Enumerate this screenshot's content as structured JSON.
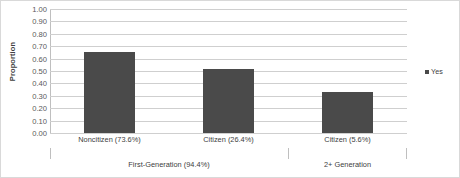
{
  "chart_data": {
    "type": "bar",
    "title": "",
    "xlabel": "",
    "ylabel": "Proportion",
    "ylim": [
      0,
      1
    ],
    "ytick_step": 0.1,
    "ytick_labels": [
      "1.00",
      "0.90",
      "0.80",
      "0.70",
      "0.60",
      "0.50",
      "0.40",
      "0.30",
      "0.20",
      "0.10",
      "0.00"
    ],
    "grid": true,
    "legend_position": "right",
    "legend": [
      "Yes"
    ],
    "categories": [
      "Noncitizen (73.6%)",
      "Citizen (26.4%)",
      "Citizen (5.6%)"
    ],
    "values": [
      0.65,
      0.52,
      0.33
    ],
    "series": [
      {
        "name": "Yes",
        "values": [
          0.65,
          0.52,
          0.33
        ]
      }
    ],
    "groups": [
      {
        "label": "First-Generation (94.4%)",
        "categories": [
          "Noncitizen (73.6%)",
          "Citizen (26.4%)"
        ]
      },
      {
        "label": "2+ Generation",
        "categories": [
          "Citizen (5.6%)"
        ]
      }
    ],
    "bar_color": "#4a4a4a",
    "gridline_color": "#cfcfcf",
    "background_color": "#ffffff"
  }
}
